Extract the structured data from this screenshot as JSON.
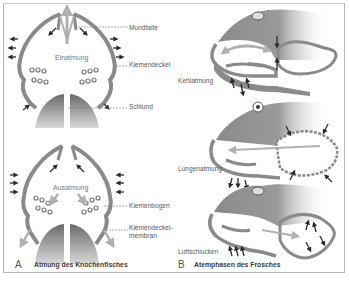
{
  "panel_a": {
    "letter": "A",
    "caption": "Atmung des Knochenfisches",
    "top_phase": "Einatmung",
    "bottom_phase": "Ausatmung",
    "labels": {
      "mundfalte": "Mundfalte",
      "kiemendeckel": "Kiemendeckel",
      "schlund": "Schlund",
      "kiemenbogen": "Kiemenbogen",
      "kiemendeckelmembran_line1": "Kiemendeckel-",
      "kiemendeckelmembran_line2": "membran"
    }
  },
  "panel_b": {
    "letter": "B",
    "caption": "Atemphasen des Frosches",
    "phases": [
      {
        "label": "Kehlatmung"
      },
      {
        "label": "Lungenatmung"
      },
      {
        "label": "Luftschlucken"
      }
    ]
  },
  "colors": {
    "tissue": "#8a8a8a",
    "tissue_dark": "#6e6e6e",
    "arrow": "#2a2a2a",
    "airflow": "#b0b0b0",
    "frame": "#b5b5b5"
  }
}
